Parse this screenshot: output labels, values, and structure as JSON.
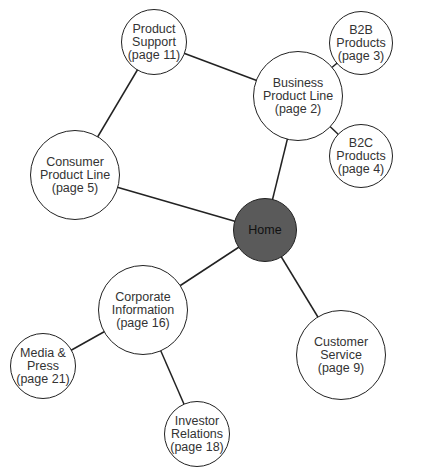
{
  "nodes": [
    {
      "id": "home",
      "lines": [
        "Home"
      ],
      "x": 265,
      "y": 230,
      "r": 32,
      "home": true
    },
    {
      "id": "product-support",
      "lines": [
        "Product",
        "Support",
        "(page 11)"
      ],
      "x": 154,
      "y": 42,
      "r": 33
    },
    {
      "id": "business-product-line",
      "lines": [
        "Business",
        "Product Line",
        "(page 2)"
      ],
      "x": 298,
      "y": 96,
      "r": 45
    },
    {
      "id": "b2b-products",
      "lines": [
        "B2B",
        "Products",
        "(page 3)"
      ],
      "x": 361,
      "y": 43,
      "r": 32
    },
    {
      "id": "b2c-products",
      "lines": [
        "B2C",
        "Products",
        "(page 4)"
      ],
      "x": 361,
      "y": 156,
      "r": 32
    },
    {
      "id": "consumer-product-line",
      "lines": [
        "Consumer",
        "Product Line",
        "(page 5)"
      ],
      "x": 75,
      "y": 175,
      "r": 45
    },
    {
      "id": "corporate-information",
      "lines": [
        "Corporate",
        "Information",
        "(page 16)"
      ],
      "x": 143,
      "y": 310,
      "r": 45
    },
    {
      "id": "media-press",
      "lines": [
        "Media &",
        "Press",
        "(page 21)"
      ],
      "x": 43,
      "y": 366,
      "r": 33
    },
    {
      "id": "investor-relations",
      "lines": [
        "Investor",
        "Relations",
        "(page 18)"
      ],
      "x": 197,
      "y": 434,
      "r": 33
    },
    {
      "id": "customer-service",
      "lines": [
        "Customer",
        "Service",
        "(page 9)"
      ],
      "x": 341,
      "y": 355,
      "r": 45
    }
  ],
  "edges": [
    [
      "product-support",
      "business-product-line"
    ],
    [
      "product-support",
      "consumer-product-line"
    ],
    [
      "business-product-line",
      "b2b-products"
    ],
    [
      "business-product-line",
      "b2c-products"
    ],
    [
      "business-product-line",
      "home"
    ],
    [
      "consumer-product-line",
      "home"
    ],
    [
      "home",
      "corporate-information"
    ],
    [
      "home",
      "customer-service"
    ],
    [
      "corporate-information",
      "media-press"
    ],
    [
      "corporate-information",
      "investor-relations"
    ]
  ],
  "colors": {
    "line": "#222222",
    "home_fill": "#5a5a5a",
    "node_fill": "#ffffff"
  }
}
